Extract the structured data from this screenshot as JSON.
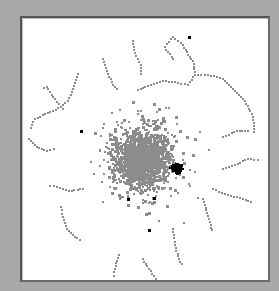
{
  "figure": {
    "type": "network-node-scatter",
    "background": "#a9a9a9",
    "panel_background": "#ffffff",
    "panel_border": "#555555",
    "node_color": "#8c8c8c",
    "highlight_color": "#000000"
  },
  "layout": {
    "center": [
      120,
      140
    ],
    "core_radius": 60,
    "node_count": 2600,
    "highlight_cluster_center": [
      154,
      149
    ],
    "highlight_cluster_count": 110,
    "highlight_scattered": [
      [
        58,
        112
      ],
      [
        105,
        180
      ],
      [
        126,
        211
      ],
      [
        131,
        179
      ],
      [
        166,
        18
      ]
    ]
  },
  "trails": [
    [
      [
        150,
        40
      ],
      [
        142,
        28
      ],
      [
        150,
        18
      ],
      [
        160,
        26
      ],
      [
        165,
        36
      ],
      [
        170,
        42
      ],
      [
        172,
        56
      ],
      [
        165,
        66
      ],
      [
        155,
        64
      ],
      [
        140,
        62
      ],
      [
        128,
        66
      ],
      [
        112,
        72
      ]
    ],
    [
      [
        172,
        56
      ],
      [
        185,
        56
      ],
      [
        200,
        60
      ],
      [
        210,
        70
      ],
      [
        222,
        82
      ],
      [
        230,
        98
      ],
      [
        232,
        116
      ]
    ],
    [
      [
        55,
        55
      ],
      [
        50,
        70
      ],
      [
        45,
        82
      ],
      [
        38,
        88
      ],
      [
        30,
        92
      ],
      [
        20,
        96
      ],
      [
        12,
        100
      ],
      [
        6,
        112
      ]
    ],
    [
      [
        40,
        90
      ],
      [
        30,
        78
      ],
      [
        24,
        68
      ],
      [
        18,
        70
      ]
    ],
    [
      [
        80,
        40
      ],
      [
        84,
        52
      ],
      [
        90,
        66
      ],
      [
        96,
        72
      ]
    ],
    [
      [
        110,
        22
      ],
      [
        112,
        34
      ],
      [
        118,
        46
      ],
      [
        118,
        58
      ]
    ],
    [
      [
        6,
        120
      ],
      [
        14,
        128
      ],
      [
        24,
        132
      ],
      [
        34,
        130
      ]
    ],
    [
      [
        38,
        188
      ],
      [
        40,
        198
      ],
      [
        44,
        210
      ],
      [
        52,
        218
      ],
      [
        60,
        222
      ]
    ],
    [
      [
        200,
        150
      ],
      [
        212,
        146
      ],
      [
        225,
        140
      ],
      [
        238,
        142
      ]
    ],
    [
      [
        190,
        170
      ],
      [
        205,
        176
      ],
      [
        220,
        180
      ],
      [
        230,
        184
      ]
    ],
    [
      [
        180,
        180
      ],
      [
        186,
        200
      ],
      [
        190,
        214
      ]
    ],
    [
      [
        150,
        210
      ],
      [
        152,
        226
      ],
      [
        156,
        240
      ],
      [
        160,
        248
      ]
    ],
    [
      [
        120,
        240
      ],
      [
        126,
        250
      ],
      [
        134,
        262
      ],
      [
        140,
        270
      ]
    ],
    [
      [
        96,
        236
      ],
      [
        92,
        250
      ],
      [
        90,
        260
      ]
    ],
    [
      [
        200,
        118
      ],
      [
        214,
        112
      ],
      [
        228,
        112
      ]
    ],
    [
      [
        60,
        170
      ],
      [
        46,
        172
      ],
      [
        34,
        168
      ],
      [
        24,
        166
      ]
    ]
  ]
}
